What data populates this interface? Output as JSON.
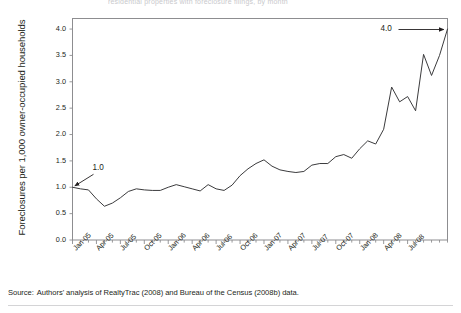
{
  "figure": {
    "top_title_clipped": "residential properties with foreclosure filings, by month",
    "y_axis_title": "Foreclosures per 1,000 owner-occupied households",
    "source_label": "Source:",
    "source_text": "Authors' analysis of RealtyTrac (2008) and Bureau of the Census (2008b) data."
  },
  "annotations": [
    {
      "name": "start-value-label",
      "text": "1.0"
    },
    {
      "name": "end-value-label",
      "text": "4.0"
    }
  ],
  "chart_data": {
    "type": "line",
    "title": "",
    "subtitle": "",
    "xlabel": "",
    "ylabel": "Foreclosures per 1,000 owner-occupied households",
    "ylim": [
      0.0,
      4.2
    ],
    "yticks": [
      "0.0",
      "0.5",
      "1.0",
      "1.5",
      "2.0",
      "2.5",
      "3.0",
      "3.5",
      "4.0"
    ],
    "ytick_values": [
      0.0,
      0.5,
      1.0,
      1.5,
      2.0,
      2.5,
      3.0,
      3.5,
      4.0
    ],
    "grid": false,
    "legend": "none",
    "minor_tick_interval": "monthly",
    "xtick_labels": [
      "Jan-05",
      "Apr-05",
      "Jul-05",
      "Oct-05",
      "Jan-06",
      "Apr-06",
      "Jul-06",
      "Oct-06",
      "Jan-07",
      "Apr-07",
      "Jul-07",
      "Oct-07",
      "Jan-08",
      "Apr-08",
      "Jul-08"
    ],
    "xtick_label_indices": [
      0,
      3,
      6,
      9,
      12,
      15,
      18,
      21,
      24,
      27,
      30,
      33,
      36,
      39,
      42
    ],
    "x": [
      "Jan-05",
      "Feb-05",
      "Mar-05",
      "Apr-05",
      "May-05",
      "Jun-05",
      "Jul-05",
      "Aug-05",
      "Sep-05",
      "Oct-05",
      "Nov-05",
      "Dec-05",
      "Jan-06",
      "Feb-06",
      "Mar-06",
      "Apr-06",
      "May-06",
      "Jun-06",
      "Jul-06",
      "Aug-06",
      "Sep-06",
      "Oct-06",
      "Nov-06",
      "Dec-06",
      "Jan-07",
      "Feb-07",
      "Mar-07",
      "Apr-07",
      "May-07",
      "Jun-07",
      "Jul-07",
      "Aug-07",
      "Sep-07",
      "Oct-07",
      "Nov-07",
      "Dec-07",
      "Jan-08",
      "Feb-08",
      "Mar-08",
      "Apr-08",
      "May-08",
      "Jun-08",
      "Jul-08",
      "Aug-08"
    ],
    "series": [
      {
        "name": "Foreclosure filings per 1,000 owner-occupied households",
        "color": "#3b3b3d",
        "values": [
          1.0,
          0.97,
          0.95,
          0.78,
          0.64,
          0.7,
          0.8,
          0.92,
          0.97,
          0.95,
          0.94,
          0.94,
          1.0,
          1.05,
          1.01,
          0.97,
          0.93,
          1.05,
          0.97,
          0.94,
          1.04,
          1.22,
          1.35,
          1.45,
          1.52,
          1.4,
          1.33,
          1.3,
          1.28,
          1.3,
          1.42,
          1.45,
          1.45,
          1.58,
          1.62,
          1.55,
          1.73,
          1.88,
          1.82,
          2.1,
          2.9,
          2.62,
          2.72,
          2.45
        ]
      }
    ],
    "annotated_points": [
      {
        "x": "Jan-05",
        "y": 1.0,
        "label": "1.0"
      },
      {
        "x": "Dec-08",
        "y": 4.0,
        "label": "4.0"
      }
    ]
  }
}
